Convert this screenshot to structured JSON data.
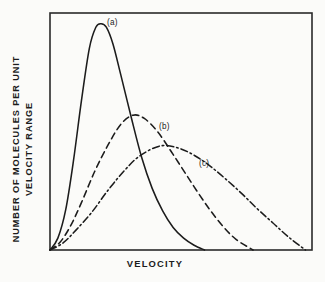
{
  "figure": {
    "background_color": "#fbfbf9",
    "frame_color": "#2a2a2a",
    "ink_color": "#1c1c1c"
  },
  "axes": {
    "xlabel": "VELOCITY",
    "ylabel_line1": "NUMBER OF MOLECULES PER UNIT",
    "ylabel_line2": "VELOCITY RANGE",
    "frame": {
      "left": 50,
      "top": 13,
      "right": 312,
      "bottom": 250
    }
  },
  "annotations": {
    "a": "(a)",
    "b": "(b)",
    "c": "(c)"
  },
  "chart_data": {
    "type": "line",
    "title": "",
    "subtitle": "",
    "xlabel": "VELOCITY",
    "ylabel": "NUMBER OF MOLECULES PER UNIT VELOCITY RANGE",
    "xlim": [
      0,
      1
    ],
    "ylim": [
      0,
      1
    ],
    "grid": false,
    "legend": "inline-curve-labels",
    "axis_ticks": {
      "x": [],
      "y": []
    },
    "series": [
      {
        "name": "(a)",
        "label": "(a)",
        "style": "solid",
        "color": "#1c1c1c",
        "peak_x": 0.195,
        "peak_y": 0.955,
        "end_x": 0.59,
        "x": [
          0.0,
          0.03,
          0.06,
          0.09,
          0.12,
          0.15,
          0.175,
          0.195,
          0.215,
          0.24,
          0.27,
          0.31,
          0.35,
          0.39,
          0.43,
          0.47,
          0.51,
          0.55,
          0.59
        ],
        "y": [
          0.0,
          0.05,
          0.17,
          0.38,
          0.63,
          0.85,
          0.94,
          0.955,
          0.94,
          0.87,
          0.74,
          0.56,
          0.39,
          0.26,
          0.165,
          0.095,
          0.05,
          0.02,
          0.0
        ]
      },
      {
        "name": "(b)",
        "label": "(b)",
        "style": "dashed",
        "color": "#1c1c1c",
        "peak_x": 0.317,
        "peak_y": 0.569,
        "end_x": 0.775,
        "x": [
          0.0,
          0.04,
          0.08,
          0.12,
          0.17,
          0.22,
          0.27,
          0.317,
          0.36,
          0.41,
          0.46,
          0.51,
          0.56,
          0.61,
          0.66,
          0.71,
          0.775
        ],
        "y": [
          0.0,
          0.035,
          0.105,
          0.2,
          0.33,
          0.44,
          0.53,
          0.569,
          0.555,
          0.5,
          0.42,
          0.335,
          0.25,
          0.17,
          0.1,
          0.045,
          0.0
        ]
      },
      {
        "name": "(c)",
        "label": "(c)",
        "style": "dashdot",
        "color": "#1c1c1c",
        "peak_x": 0.42,
        "peak_y": 0.439,
        "end_x": 0.975,
        "x": [
          0.0,
          0.05,
          0.1,
          0.16,
          0.22,
          0.28,
          0.34,
          0.42,
          0.49,
          0.55,
          0.61,
          0.67,
          0.73,
          0.79,
          0.85,
          0.91,
          0.975
        ],
        "y": [
          0.0,
          0.03,
          0.085,
          0.16,
          0.25,
          0.33,
          0.395,
          0.439,
          0.43,
          0.4,
          0.355,
          0.3,
          0.24,
          0.175,
          0.115,
          0.055,
          0.0
        ]
      }
    ]
  }
}
